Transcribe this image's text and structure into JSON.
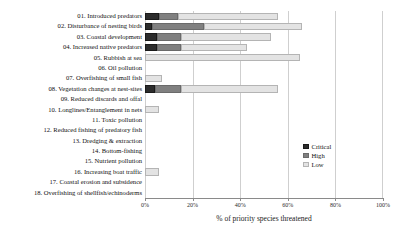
{
  "chart_data": {
    "type": "bar",
    "orientation": "horizontal",
    "stacked": true,
    "title": "",
    "xlabel": "% of priority species threatened",
    "ylabel": "",
    "xlim": [
      0,
      100
    ],
    "xticks": [
      "0%",
      "20%",
      "40%",
      "60%",
      "80%",
      "100%"
    ],
    "xtick_values": [
      0,
      20,
      40,
      60,
      80,
      100
    ],
    "grid": "vertical",
    "legend_position": "right-middle",
    "legend": [
      "Critical",
      "High",
      "Low"
    ],
    "colors": {
      "critical": "#2c2c2c",
      "high": "#808080",
      "low": "#e3e3e3"
    },
    "categories": [
      "01. Introduced predators",
      "02. Disturbance of nesting birds",
      "03. Coastal development",
      "04. Increased native predators",
      "05. Rubbish at sea",
      "06. Oil pollution",
      "07. Overfishing of small fish",
      "08. Vegetation changes at nest-sites",
      "09. Reduced discards and offal",
      "10. Longlines/Entanglement in nets",
      "11. Toxic pollution",
      "12. Reduced fishing of predatory fish",
      "13. Dredging & extraction",
      "14. Bottom-fishing",
      "15. Nutrient pollution",
      "16. Increasing boat traffic",
      "17. Coastal erosion and subsidence",
      "18. Overfishing of shellfish/echinoderms"
    ],
    "series": [
      {
        "name": "Critical",
        "values": [
          6,
          3,
          5,
          5,
          0,
          0,
          0,
          4,
          0,
          0,
          0,
          0,
          0,
          0,
          0,
          0,
          0,
          0
        ]
      },
      {
        "name": "High",
        "values": [
          8,
          22,
          10,
          10,
          0,
          0,
          0,
          11,
          0,
          0,
          0,
          0,
          0,
          0,
          0,
          0,
          0,
          0
        ]
      },
      {
        "name": "Low",
        "values": [
          42,
          41,
          38,
          28,
          65,
          0,
          7,
          41,
          0,
          6,
          0,
          0,
          0,
          0,
          0,
          6,
          0,
          0
        ]
      }
    ],
    "totals": [
      56,
      66,
      53,
      43,
      65,
      0,
      7,
      56,
      0,
      6,
      0,
      0,
      0,
      0,
      0,
      6,
      0,
      0
    ]
  }
}
